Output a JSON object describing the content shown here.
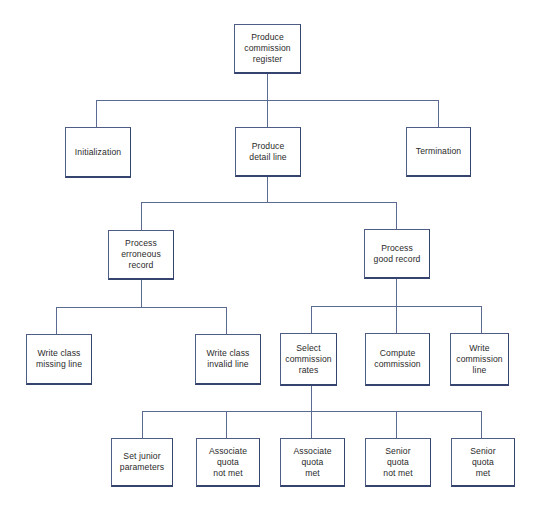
{
  "diagram": {
    "type": "hierarchy-chart",
    "line_color": "#5b6a90",
    "box_border_color": "#34446e",
    "nodes": {
      "root": {
        "label": "Produce\ncommission\nregister"
      },
      "init": {
        "label": "Initialization"
      },
      "detail": {
        "label": "Produce\ndetail line"
      },
      "term": {
        "label": "Termination"
      },
      "erroneous": {
        "label": "Process\nerroneous\nrecord"
      },
      "good": {
        "label": "Process\ngood record"
      },
      "missing": {
        "label": "Write class\nmissing line"
      },
      "invalid": {
        "label": "Write class\ninvalid line"
      },
      "select": {
        "label": "Select\ncommission\nrates"
      },
      "compute": {
        "label": "Compute\ncommission"
      },
      "writeline": {
        "label": "Write\ncommission\nline"
      },
      "junior": {
        "label": "Set junior\nparameters"
      },
      "assoc_not_met": {
        "label": "Associate\nquota\nnot met"
      },
      "assoc_met": {
        "label": "Associate\nquota\nmet"
      },
      "senior_not_met": {
        "label": "Senior\nquota\nnot met"
      },
      "senior_met": {
        "label": "Senior\nquota\nmet"
      }
    },
    "edges": [
      [
        "root",
        "init"
      ],
      [
        "root",
        "detail"
      ],
      [
        "root",
        "term"
      ],
      [
        "detail",
        "erroneous"
      ],
      [
        "detail",
        "good"
      ],
      [
        "erroneous",
        "missing"
      ],
      [
        "erroneous",
        "invalid"
      ],
      [
        "good",
        "select"
      ],
      [
        "good",
        "compute"
      ],
      [
        "good",
        "writeline"
      ],
      [
        "select",
        "junior"
      ],
      [
        "select",
        "assoc_not_met"
      ],
      [
        "select",
        "assoc_met"
      ],
      [
        "select",
        "senior_not_met"
      ],
      [
        "select",
        "senior_met"
      ]
    ]
  }
}
